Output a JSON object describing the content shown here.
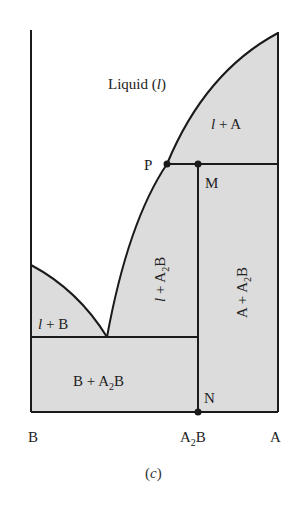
{
  "figure": {
    "caption": "(c)",
    "caption_open": "(",
    "caption_letter": "c",
    "caption_close": ")",
    "type": "binary phase diagram (incongruent melting compound)",
    "colors": {
      "two_phase_fill": "#dcdcdc",
      "line": "#1a1a1a",
      "background": "#ffffff"
    }
  },
  "regions": {
    "liquid": {
      "main": "Liquid (",
      "ital": "l",
      "close": ")"
    },
    "l_plus_A": {
      "ital": "l",
      "rest": " + A"
    },
    "l_plus_A2B": {
      "ital": "l",
      "rest": " + A",
      "sub": "2",
      "tail": "B"
    },
    "A_plus_A2B": {
      "head": "A + A",
      "sub": "2",
      "tail": "B"
    },
    "l_plus_B": {
      "ital": "l",
      "rest": " + B"
    },
    "B_plus_A2B": {
      "head": "B + A",
      "sub": "2",
      "tail": "B"
    }
  },
  "points": {
    "P": "P",
    "M": "M",
    "N": "N"
  },
  "axis": {
    "left": "B",
    "middle_head": "A",
    "middle_sub": "2",
    "middle_tail": "B",
    "right": "A"
  }
}
